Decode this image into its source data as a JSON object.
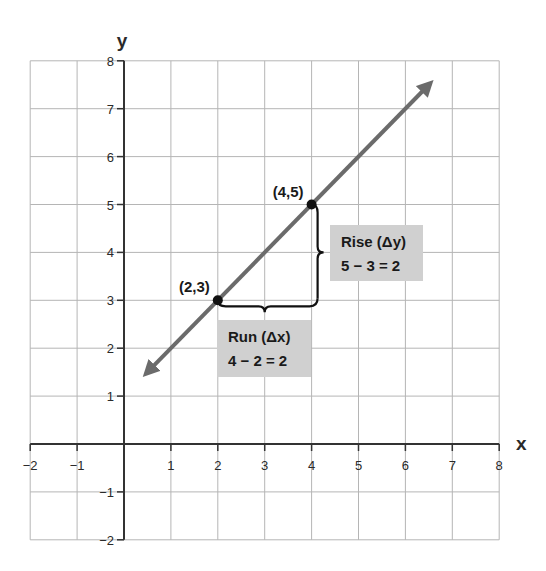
{
  "chart_data": {
    "type": "line",
    "title": "",
    "xlabel": "x",
    "ylabel": "y",
    "xlim": [
      -2,
      8
    ],
    "ylim": [
      -2,
      8
    ],
    "grid": true,
    "x_ticks": [
      "-2",
      "-1",
      "1",
      "2",
      "3",
      "4",
      "5",
      "6",
      "7",
      "8"
    ],
    "y_ticks": [
      "8",
      "7",
      "6",
      "5",
      "4",
      "3",
      "2",
      "1",
      "-1",
      "-2"
    ],
    "series": [
      {
        "name": "line y = x + 1",
        "x": [
          0.5,
          6.5
        ],
        "y": [
          1.5,
          7.5
        ],
        "color": "#6b6b6b",
        "arrows": "both"
      }
    ],
    "points": [
      {
        "label": "(2,3)",
        "x": 2,
        "y": 3
      },
      {
        "label": "(4,5)",
        "x": 4,
        "y": 5
      }
    ],
    "annotations": [
      {
        "name": "run",
        "line1": "Run (Δx)",
        "line2": "4 − 2 = 2",
        "background": "#d0d0d0"
      },
      {
        "name": "rise",
        "line1": "Rise (Δy)",
        "line2": "5 − 3 = 2",
        "background": "#d0d0d0"
      }
    ]
  },
  "colors": {
    "grid": "#b5b5b5",
    "axis": "#333333",
    "line": "#6b6b6b",
    "point": "#111111",
    "box": "#d0d0d0"
  }
}
